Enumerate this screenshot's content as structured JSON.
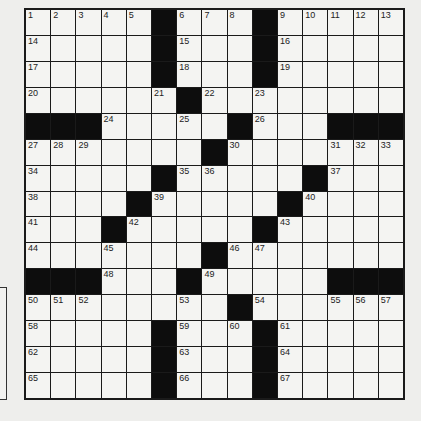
{
  "puzzle": {
    "rows": 15,
    "cols": 15,
    "grid": [
      "1,2,3,4,5,#,6,7,8,#,9,10,11,12,13",
      "14,.,.,.,.,#,15,.,.,#,16,.,.,.,.",
      "17,.,.,.,.,#,18,.,.,#,19,.,.,.,.",
      "20,.,.,.,.,21,#,22,.,23,.,.,.,.,.",
      "#,#,#,24,.,.,25,.,#,26,.,.,#,#,#",
      "27,28,29,.,.,.,.,#,30,.,.,.,31,32,33",
      "34,.,.,.,.,#,35,36,.,.,.,#,37,.,.",
      "38,.,.,.,#,39,.,.,.,.,#,40,.,.,.",
      "41,.,.,#,42,.,.,.,.,#,43,.,.,.,.",
      "44,.,.,45,.,.,.,#,46,47,.,.,.,.,.",
      "#,#,#,48,.,.,#,49,.,.,.,.,#,#,#",
      "50,51,52,.,.,.,53,.,#,54,.,.,55,56,57",
      "58,.,.,.,.,#,59,.,60,#,61,.,.,.,.",
      "62,.,.,.,.,#,63,.,.,#,64,.,.,.,.",
      "65,.,.,.,.,#,66,.,.,#,67,.,.,.,."
    ]
  },
  "colors": {
    "background": "#eeeeec",
    "cell": "#f4f4f2",
    "block": "#0d0d0d",
    "line": "#1a1a1a"
  }
}
